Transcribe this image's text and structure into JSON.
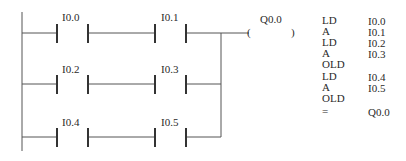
{
  "diagram": {
    "type": "ladder-logic",
    "rungs": [
      {
        "contacts": [
          "I0.0",
          "I0.1"
        ]
      },
      {
        "contacts": [
          "I0.2",
          "I0.3"
        ]
      },
      {
        "contacts": [
          "I0.4",
          "I0.5"
        ]
      }
    ],
    "coil": {
      "label": "Q0.0",
      "open": "(",
      "close": ")"
    }
  },
  "instruction_list": [
    {
      "op": "LD",
      "operand": "I0.0"
    },
    {
      "op": "A",
      "operand": "I0.1"
    },
    {
      "op": "LD",
      "operand": "I0.2"
    },
    {
      "op": "A",
      "operand": "I0.3"
    },
    {
      "op": "OLD",
      "operand": ""
    },
    {
      "op": "LD",
      "operand": "I0.4"
    },
    {
      "op": "A",
      "operand": "I0.5"
    },
    {
      "op": "OLD",
      "operand": ""
    },
    {
      "op": "=",
      "operand": "Q0.0"
    }
  ],
  "colors": {
    "line": "#555555",
    "text": "#2a2a2a"
  }
}
